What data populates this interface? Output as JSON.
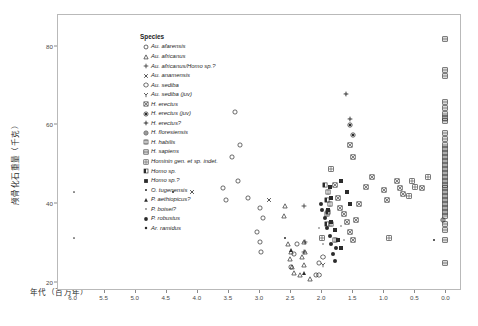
{
  "chart_data": {
    "type": "scatter",
    "title": "",
    "xlabel": "年代（百万年）",
    "ylabel": "颅骨化石重量（千克）",
    "xlim": [
      6.25,
      -0.25
    ],
    "ylim": [
      18,
      88
    ],
    "x_ticks": [
      "6.0",
      "5.5",
      "5.0",
      "4.5",
      "4.0",
      "3.5",
      "3.0",
      "2.5",
      "2.0",
      "1.5",
      "1.0",
      "0.5",
      "0.0"
    ],
    "x_tick_values": [
      6.0,
      5.5,
      5.0,
      4.5,
      4.0,
      3.5,
      3.0,
      2.5,
      2.0,
      1.5,
      1.0,
      0.5,
      0.0
    ],
    "y_ticks": [
      "20",
      "40",
      "60",
      "80"
    ],
    "y_tick_values": [
      20,
      40,
      60,
      80
    ],
    "grid": false,
    "legend_position": "top-left-inside",
    "legend_title": "Species",
    "x_axis_reversed": true,
    "series": [
      {
        "name": "Au. afarensis",
        "marker": "circle-open",
        "points": [
          [
            3.4,
            63.5
          ],
          [
            3.32,
            55.0
          ],
          [
            3.45,
            52.0
          ],
          [
            3.35,
            46.0
          ],
          [
            3.2,
            41.5
          ],
          [
            3.0,
            39.0
          ],
          [
            2.95,
            36.5
          ],
          [
            3.05,
            33.0
          ],
          [
            3.0,
            30.5
          ],
          [
            2.98,
            28.0
          ],
          [
            2.5,
            24.0
          ],
          [
            2.1,
            22.0
          ],
          [
            2.05,
            25.0
          ],
          [
            2.4,
            30.0
          ],
          [
            2.45,
            27.5
          ],
          [
            3.6,
            44.0
          ],
          [
            3.55,
            41.0
          ]
        ]
      },
      {
        "name": "Au. africanus",
        "marker": "triangle-open",
        "points": [
          [
            2.6,
            39.5
          ],
          [
            2.62,
            37.0
          ],
          [
            2.55,
            30.0
          ],
          [
            2.5,
            28.0
          ],
          [
            2.52,
            26.0
          ],
          [
            2.48,
            24.0
          ],
          [
            2.45,
            22.5
          ],
          [
            2.3,
            30.5
          ],
          [
            2.28,
            28.0
          ],
          [
            2.32,
            26.5
          ],
          [
            2.3,
            24.5
          ],
          [
            2.35,
            22.0
          ],
          [
            2.2,
            21.0
          ]
        ]
      },
      {
        "name": "Au. africanus/Homo sp.?",
        "marker": "plus",
        "points": [
          [
            2.3,
            39.5
          ],
          [
            2.28,
            30.5
          ],
          [
            2.3,
            28.0
          ]
        ]
      },
      {
        "name": "Au. anamensis",
        "marker": "x",
        "points": [
          [
            4.1,
            43.0
          ],
          [
            2.85,
            41.0
          ]
        ]
      },
      {
        "name": "Au. sediba",
        "marker": "hexagon-open",
        "points": [
          [
            1.98,
            26.5
          ],
          [
            2.05,
            22.0
          ]
        ]
      },
      {
        "name": "Au. sediba (juv)",
        "marker": "y-open",
        "points": [
          [
            1.98,
            24.5
          ]
        ]
      },
      {
        "name": "H. erectus",
        "marker": "square-x",
        "points": [
          [
            1.8,
            45.0
          ],
          [
            1.75,
            41.5
          ],
          [
            1.72,
            39.0
          ],
          [
            1.65,
            37.5
          ],
          [
            1.6,
            35.5
          ],
          [
            1.55,
            33.0
          ],
          [
            1.5,
            31.0
          ],
          [
            1.45,
            36.0
          ],
          [
            1.4,
            40.0
          ],
          [
            1.3,
            44.5
          ],
          [
            1.2,
            47.0
          ],
          [
            1.0,
            43.5
          ],
          [
            0.95,
            41.0
          ],
          [
            0.8,
            46.0
          ],
          [
            0.75,
            44.0
          ],
          [
            0.7,
            42.5
          ],
          [
            1.55,
            55.0
          ],
          [
            1.5,
            52.0
          ],
          [
            0.4,
            44.0
          ]
        ]
      },
      {
        "name": "H. erectus (juv)",
        "marker": "circle-filled-ring",
        "points": [
          [
            1.55,
            60.0
          ],
          [
            1.5,
            57.5
          ]
        ]
      },
      {
        "name": "H. erectus?",
        "marker": "cross-diamond",
        "points": [
          [
            1.62,
            68.0
          ],
          [
            1.55,
            61.5
          ]
        ]
      },
      {
        "name": "H. floresiensis",
        "marker": "circle-cross",
        "points": [
          [
            0.05,
            36.0
          ]
        ]
      },
      {
        "name": "H. habilis",
        "marker": "square-open-tick",
        "points": [
          [
            1.9,
            43.0
          ],
          [
            1.88,
            40.0
          ],
          [
            1.92,
            37.5
          ],
          [
            1.85,
            35.0
          ],
          [
            1.8,
            31.0
          ]
        ]
      },
      {
        "name": "H. sapiens",
        "marker": "square-lines",
        "points": [
          [
            0.02,
            82.0
          ],
          [
            0.02,
            74.0
          ],
          [
            0.02,
            72.5
          ],
          [
            0.02,
            66.0
          ],
          [
            0.02,
            64.5
          ],
          [
            0.02,
            63.0
          ],
          [
            0.02,
            62.0
          ],
          [
            0.02,
            61.0
          ],
          [
            0.02,
            58.0
          ],
          [
            0.02,
            56.5
          ],
          [
            0.02,
            55.0
          ],
          [
            0.02,
            54.0
          ],
          [
            0.02,
            53.0
          ],
          [
            0.02,
            52.0
          ],
          [
            0.02,
            51.0
          ],
          [
            0.02,
            50.0
          ],
          [
            0.02,
            49.0
          ],
          [
            0.02,
            48.0
          ],
          [
            0.02,
            47.0
          ],
          [
            0.02,
            46.0
          ],
          [
            0.02,
            45.0
          ],
          [
            0.02,
            44.0
          ],
          [
            0.02,
            43.0
          ],
          [
            0.02,
            42.0
          ],
          [
            0.02,
            41.0
          ],
          [
            0.02,
            40.0
          ],
          [
            0.02,
            39.0
          ],
          [
            0.02,
            38.0
          ],
          [
            0.02,
            37.0
          ],
          [
            0.02,
            35.0
          ],
          [
            0.02,
            33.5
          ],
          [
            0.02,
            31.0
          ],
          [
            0.02,
            25.0
          ]
        ]
      },
      {
        "name": "Hominin gen. et sp. indet.",
        "marker": "square-grid",
        "points": [
          [
            0.55,
            46.0
          ],
          [
            0.5,
            44.5
          ],
          [
            0.6,
            42.0
          ],
          [
            0.3,
            47.0
          ],
          [
            1.85,
            49.0
          ],
          [
            0.92,
            31.5
          ],
          [
            2.0,
            31.5
          ]
        ]
      },
      {
        "name": "Homo sp.",
        "marker": "square-half",
        "points": [
          [
            1.95,
            45.0
          ],
          [
            1.93,
            41.0
          ],
          [
            1.9,
            38.0
          ],
          [
            1.92,
            35.0
          ]
        ]
      },
      {
        "name": "Homo sp.?",
        "marker": "square-filled",
        "points": [
          [
            1.88,
            44.5
          ],
          [
            1.85,
            41.5
          ],
          [
            1.9,
            38.5
          ],
          [
            1.85,
            35.5
          ],
          [
            1.8,
            33.5
          ],
          [
            1.75,
            31.0
          ],
          [
            1.7,
            29.0
          ],
          [
            1.6,
            43.0
          ],
          [
            1.55,
            40.0
          ],
          [
            1.7,
            46.0
          ]
        ]
      },
      {
        "name": "O. tugenensis",
        "marker": "dot-small",
        "points": [
          [
            6.0,
            43.0
          ],
          [
            6.0,
            31.5
          ]
        ]
      },
      {
        "name": "P. aethiopicus?",
        "marker": "triangle-filled",
        "points": [
          [
            2.5,
            28.5
          ],
          [
            2.3,
            22.5
          ]
        ]
      },
      {
        "name": "P. boisei?",
        "marker": "dot-tiny",
        "points": [
          [
            2.05,
            34.0
          ],
          [
            1.98,
            30.0
          ],
          [
            1.7,
            34.5
          ],
          [
            1.65,
            31.0
          ]
        ]
      },
      {
        "name": "P. robustus",
        "marker": "circle-big-filled",
        "points": [
          [
            1.95,
            36.5
          ],
          [
            1.92,
            34.0
          ],
          [
            1.88,
            32.0
          ],
          [
            1.85,
            30.0
          ],
          [
            1.82,
            27.5
          ],
          [
            2.0,
            38.5
          ],
          [
            2.02,
            40.0
          ],
          [
            1.8,
            25.5
          ],
          [
            1.78,
            29.0
          ]
        ]
      },
      {
        "name": "Ar. ramidus",
        "marker": "dot-med",
        "points": [
          [
            4.4,
            43.0
          ],
          [
            2.6,
            31.5
          ],
          [
            0.2,
            31.0
          ]
        ]
      }
    ]
  },
  "legend": {
    "title": "Species",
    "items": [
      {
        "label": "Au. afarensis",
        "marker": "circle-open"
      },
      {
        "label": "Au. africanus",
        "marker": "triangle-open"
      },
      {
        "label": "Au. africanus/Homo sp.?",
        "marker": "plus"
      },
      {
        "label": "Au. anamensis",
        "marker": "x"
      },
      {
        "label": "Au. sediba",
        "marker": "hexagon-open"
      },
      {
        "label": "Au. sediba (juv)",
        "marker": "y-open"
      },
      {
        "label": "H. erectus",
        "marker": "square-x"
      },
      {
        "label": "H. erectus (juv)",
        "marker": "circle-filled-ring"
      },
      {
        "label": "H. erectus?",
        "marker": "cross-diamond"
      },
      {
        "label": "H. floresiensis",
        "marker": "circle-cross"
      },
      {
        "label": "H. habilis",
        "marker": "square-open-tick"
      },
      {
        "label": "H. sapiens",
        "marker": "square-lines"
      },
      {
        "label": "Hominin gen. et sp. indet.",
        "marker": "square-grid"
      },
      {
        "label": "Homo sp.",
        "marker": "square-half"
      },
      {
        "label": "Homo sp.?",
        "marker": "square-filled"
      },
      {
        "label": "O. tugenensis",
        "marker": "dot-small"
      },
      {
        "label": "P. aethiopicus?",
        "marker": "triangle-filled"
      },
      {
        "label": "P. boisei?",
        "marker": "dot-tiny"
      },
      {
        "label": "P. robustus",
        "marker": "circle-big-filled"
      },
      {
        "label": "Ar. ramidus",
        "marker": "dot-med"
      }
    ]
  },
  "colors": {
    "marker": "#2b2b2b",
    "axis": "#8a8a8a",
    "frame": "#b9b9b9",
    "text": "#2b2b2b",
    "background": "#ffffff"
  }
}
